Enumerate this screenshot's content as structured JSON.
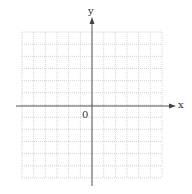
{
  "chart_data": {
    "type": "scatter",
    "title": "",
    "xlabel": "x",
    "ylabel": "y",
    "origin_label": "0",
    "grid": true,
    "grid_style": "dotted",
    "grid_cells_x": 12,
    "grid_cells_y": 12,
    "xlim": [
      -6,
      6
    ],
    "ylim": [
      -6,
      6
    ],
    "x_ticks_labeled": [],
    "y_ticks_labeled": [],
    "series": [],
    "colors": {
      "axis": "#555555",
      "grid": "#c8c8c8",
      "text": "#333333"
    }
  }
}
